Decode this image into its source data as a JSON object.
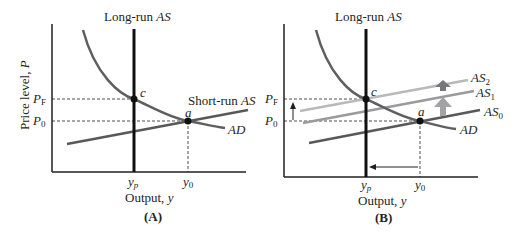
{
  "colors": {
    "axis": "#231f20",
    "lras": "#111111",
    "ad": "#5f5f61",
    "as0": "#58585a",
    "as1": "#9a9a9c",
    "as2": "#b9b9bb",
    "arrow_dark": "#777779",
    "arrow_light": "#a3a3a5"
  },
  "panelA": {
    "caption": "(A)",
    "lras_label_pre": "Long-run ",
    "lras_label_it": "AS",
    "sras_label_pre": "Short-run ",
    "sras_label_it": "AS",
    "ad_label": "AD",
    "ylabel_pre": "Price level, ",
    "ylabel_it": "P",
    "xlabel_pre": "Output, ",
    "xlabel_it": "y",
    "pf": "P",
    "pf_sub": "F",
    "p0": "P",
    "p0_sub": "0",
    "yp": "y",
    "yp_sub": "p",
    "y0": "y",
    "y0_sub": "0",
    "point_c": "c",
    "point_a": "a"
  },
  "panelB": {
    "caption": "(B)",
    "lras_label_pre": "Long-run ",
    "lras_label_it": "AS",
    "as2": "AS",
    "as2_sub": "2",
    "as1": "AS",
    "as1_sub": "1",
    "as0": "AS",
    "as0_sub": "0",
    "ad_label": "AD",
    "xlabel_pre": "Output, ",
    "xlabel_it": "y",
    "pf": "P",
    "pf_sub": "F",
    "p0": "P",
    "p0_sub": "0",
    "yp": "y",
    "yp_sub": "p",
    "y0": "y",
    "y0_sub": "0",
    "point_c": "c",
    "point_a": "a"
  }
}
